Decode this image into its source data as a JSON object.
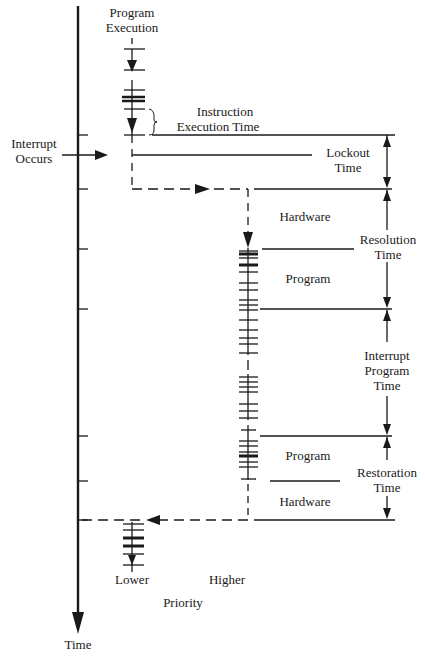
{
  "labels": {
    "program_execution_1": "Program",
    "program_execution_2": "Execution",
    "instruction_exec_1": "Instruction",
    "instruction_exec_2": "Execution Time",
    "interrupt_occurs_1": "Interrupt",
    "interrupt_occurs_2": "Occurs",
    "lockout_1": "Lockout",
    "lockout_2": "Time",
    "hardware_top": "Hardware",
    "resolution_1": "Resolution",
    "resolution_2": "Time",
    "program_top": "Program",
    "interrupt_program_1": "Interrupt",
    "interrupt_program_2": "Program",
    "interrupt_program_3": "Time",
    "program_bottom": "Program",
    "restoration_1": "Restoration",
    "restoration_2": "Time",
    "hardware_bottom": "Hardware",
    "lower": "Lower",
    "higher": "Higher",
    "priority": "Priority",
    "time": "Time"
  },
  "colors": {
    "ink": "#1a1a1a",
    "background": "#ffffff"
  }
}
